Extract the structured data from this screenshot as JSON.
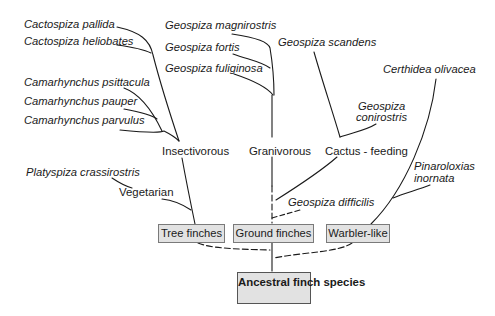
{
  "diagram": {
    "type": "phylogenetic-tree",
    "root": "Ancestral finch species",
    "lineages": [
      {
        "label": "Tree finches"
      },
      {
        "label": "Ground finches"
      },
      {
        "label": "Warbler-like"
      }
    ],
    "diet_groups": {
      "insectivorous": "Insectivorous",
      "vegetarian": "Vegetarian",
      "granivorous": "Granivorous",
      "cactus_feeding": "Cactus - feeding"
    },
    "species": {
      "cactospiza_pallida": "Cactospiza pallida",
      "cactospiza_heliobates": "Cactospiza heliobates",
      "camarhynchus_psittacula": "Camarhynchus psittacula",
      "camarhynchus_pauper": "Camarhynchus pauper",
      "camarhynchus_parvulus": "Camarhynchus parvulus",
      "platyspiza_crassirostris": "Platyspiza crassirostris",
      "geospiza_magnirostris": "Geospiza magnirostris",
      "geospiza_fortis": "Geospiza fortis",
      "geospiza_fuliginosa": "Geospiza fuliginosa",
      "geospiza_scandens": "Geospiza scandens",
      "geospiza_conirostris_1": "Geospiza",
      "geospiza_conirostris_2": "conirostris",
      "geospiza_difficilis": "Geospiza difficilis",
      "certhidea_olivacea": "Certhidea olivacea",
      "pinaroloxias_inornata_1": "Pinaroloxias",
      "pinaroloxias_inornata_2": "inornata"
    },
    "colors": {
      "line": "#1a1a1a",
      "box_fill": "#e2e2e2",
      "box_border": "#7a7a7a"
    }
  }
}
